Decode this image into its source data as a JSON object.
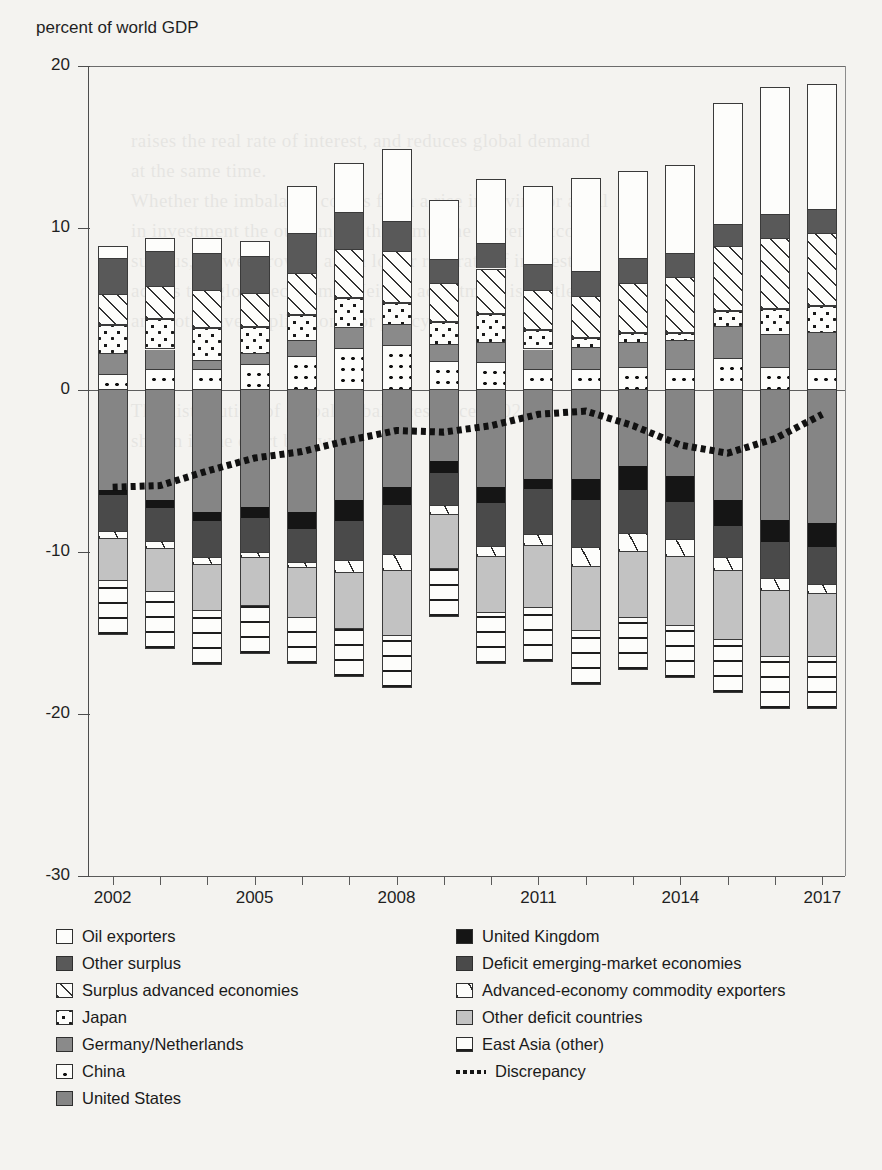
{
  "axis_title": "percent of world GDP",
  "legend": {
    "left_column": [
      {
        "label": "Oil exporters",
        "pattern": "f-oil"
      },
      {
        "label": "Other surplus",
        "pattern": "f-othersurplus"
      },
      {
        "label": "Surplus advanced economies",
        "pattern": "f-surpadv"
      },
      {
        "label": "Japan",
        "pattern": "f-japan"
      },
      {
        "label": "Germany/Netherlands",
        "pattern": "f-germany"
      },
      {
        "label": "China",
        "pattern": "f-china"
      },
      {
        "label": "United States",
        "pattern": "f-us"
      }
    ],
    "right_column": [
      {
        "label": "United Kingdom",
        "pattern": "f-uk"
      },
      {
        "label": "Deficit emerging-market economies",
        "pattern": "f-deficitem"
      },
      {
        "label": "Advanced-economy commodity exporters",
        "pattern": "f-advcomm"
      },
      {
        "label": "Other deficit countries",
        "pattern": "f-otherdef"
      },
      {
        "label": "East Asia (other)",
        "pattern": "f-eastasia"
      },
      {
        "label": "Discrepancy",
        "pattern": "line"
      }
    ]
  },
  "chart_data": {
    "type": "bar",
    "title": "",
    "subtitle": "",
    "xlabel": "",
    "ylabel": "percent of world GDP",
    "grid": false,
    "stacked": true,
    "legend_position": "bottom",
    "ylim": [
      -30,
      20
    ],
    "yticks": [
      20,
      10,
      0,
      -10,
      -20,
      -30
    ],
    "ytick_labels": [
      "20",
      "10",
      "0",
      "-10",
      "-20",
      "-30"
    ],
    "categories": [
      2002,
      2003,
      2004,
      2005,
      2006,
      2007,
      2008,
      2009,
      2010,
      2011,
      2012,
      2013,
      2014,
      2015,
      2016,
      2017
    ],
    "xtick_labels": [
      "2002",
      "2005",
      "2008",
      "2011",
      "2014",
      "2017"
    ],
    "xtick_values": [
      2002,
      2005,
      2008,
      2011,
      2014,
      2017
    ],
    "series": [
      {
        "name": "China",
        "pattern": "f-china",
        "side": "positive",
        "values": [
          1.0,
          1.3,
          1.3,
          1.6,
          2.1,
          2.6,
          2.8,
          1.8,
          1.7,
          1.3,
          1.3,
          1.4,
          1.3,
          2.0,
          1.4,
          1.3
        ]
      },
      {
        "name": "Germany/Netherlands",
        "pattern": "f-germany",
        "side": "positive",
        "values": [
          1.2,
          1.2,
          0.5,
          0.6,
          0.9,
          1.2,
          1.2,
          1.0,
          1.2,
          1.2,
          1.3,
          1.5,
          1.7,
          1.9,
          2.0,
          2.2
        ]
      },
      {
        "name": "Japan",
        "pattern": "f-japan",
        "side": "positive",
        "values": [
          1.8,
          1.9,
          2.0,
          1.7,
          1.6,
          1.9,
          1.4,
          1.4,
          1.8,
          1.2,
          0.6,
          0.6,
          0.5,
          1.0,
          1.6,
          1.7
        ]
      },
      {
        "name": "Surplus advanced economies",
        "pattern": "f-surpadv",
        "side": "positive",
        "values": [
          1.9,
          2.0,
          2.4,
          2.1,
          2.6,
          3.0,
          3.2,
          2.4,
          2.8,
          2.5,
          2.6,
          3.1,
          3.5,
          4.0,
          4.4,
          4.5
        ]
      },
      {
        "name": "Other surplus",
        "pattern": "f-othersurplus",
        "side": "positive",
        "values": [
          2.2,
          2.1,
          2.2,
          2.2,
          2.4,
          2.2,
          1.8,
          1.4,
          1.5,
          1.5,
          1.5,
          1.5,
          1.4,
          1.3,
          1.4,
          1.4
        ]
      },
      {
        "name": "Oil exporters",
        "pattern": "f-oil",
        "side": "positive",
        "values": [
          0.8,
          0.9,
          1.0,
          1.0,
          3.0,
          3.1,
          4.5,
          3.7,
          4.0,
          4.9,
          5.8,
          5.4,
          5.5,
          7.5,
          7.9,
          7.8
        ]
      },
      {
        "name": "United States",
        "pattern": "f-us",
        "side": "negative",
        "values": [
          -6.2,
          -6.8,
          -7.5,
          -7.2,
          -7.5,
          -6.8,
          -6.0,
          -4.4,
          -6.0,
          -5.5,
          -5.5,
          -4.7,
          -5.3,
          -6.8,
          -8.0,
          -8.2
        ]
      },
      {
        "name": "United Kingdom",
        "pattern": "f-uk",
        "side": "negative",
        "values": [
          -0.3,
          -0.5,
          -0.6,
          -0.7,
          -1.1,
          -1.3,
          -1.1,
          -0.7,
          -1.0,
          -0.6,
          -1.3,
          -1.5,
          -1.6,
          -1.6,
          -1.4,
          -1.5
        ]
      },
      {
        "name": "Deficit emerging-market economies",
        "pattern": "f-deficitem",
        "side": "negative",
        "values": [
          -2.2,
          -2.0,
          -2.2,
          -2.1,
          -2.0,
          -2.4,
          -3.0,
          -2.0,
          -2.6,
          -2.8,
          -2.9,
          -2.6,
          -2.3,
          -1.9,
          -2.2,
          -2.3
        ]
      },
      {
        "name": "Advanced-economy commodity exporters",
        "pattern": "f-advcomm",
        "side": "negative",
        "values": [
          -0.5,
          -0.5,
          -0.5,
          -0.4,
          -0.4,
          -0.8,
          -1.1,
          -0.6,
          -0.7,
          -0.7,
          -1.2,
          -1.2,
          -1.1,
          -0.9,
          -0.8,
          -0.6
        ]
      },
      {
        "name": "Other deficit countries",
        "pattern": "f-otherdef",
        "side": "negative",
        "values": [
          -2.5,
          -2.6,
          -2.8,
          -2.9,
          -3.0,
          -3.4,
          -3.9,
          -3.3,
          -3.4,
          -3.8,
          -3.9,
          -4.0,
          -4.2,
          -4.2,
          -4.0,
          -3.8
        ]
      },
      {
        "name": "East Asia (other)",
        "pattern": "f-eastasia",
        "side": "negative",
        "values": [
          -3.4,
          -3.6,
          -3.4,
          -3.0,
          -2.9,
          -3.0,
          -3.3,
          -3.0,
          -3.2,
          -3.4,
          -3.4,
          -3.3,
          -3.3,
          -3.3,
          -3.3,
          -3.3
        ]
      }
    ],
    "overlay_line": {
      "name": "Discrepancy",
      "style": "dotted",
      "values": [
        -6.0,
        -5.9,
        -5.0,
        -4.2,
        -3.8,
        -3.1,
        -2.5,
        -2.6,
        -2.2,
        -1.5,
        -1.3,
        -2.2,
        -3.4,
        -3.9,
        -3.0,
        -1.5
      ]
    }
  }
}
